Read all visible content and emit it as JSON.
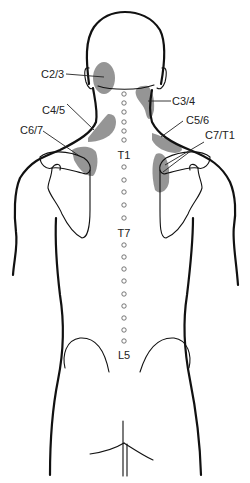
{
  "diagram": {
    "zone_color": "#8c8c8c",
    "outline_color": "#111111",
    "zone_labels": [
      {
        "id": "c2-3",
        "text": "C2/3"
      },
      {
        "id": "c3-4",
        "text": "C3/4"
      },
      {
        "id": "c4-5",
        "text": "C4/5"
      },
      {
        "id": "c5-6",
        "text": "C5/6"
      },
      {
        "id": "c6-7",
        "text": "C6/7"
      },
      {
        "id": "c7-t1",
        "text": "C7/T1"
      }
    ],
    "spine_labels": [
      {
        "id": "t1",
        "text": "T1"
      },
      {
        "id": "t7",
        "text": "T7"
      },
      {
        "id": "l5",
        "text": "L5"
      }
    ]
  }
}
